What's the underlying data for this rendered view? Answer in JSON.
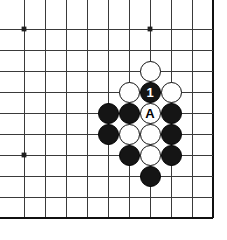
{
  "board": {
    "kind": "go-board-diagram",
    "title": "Go board position diagram",
    "background_color": "#ffffff",
    "line_color": "#3a3a3a",
    "edge_color": "#101010",
    "star_point_color": "#202020",
    "black_stone_color": "#151515",
    "white_stone_color": "#ffffff",
    "geometry": {
      "origin_x": 24,
      "origin_y": 29,
      "cell": 21,
      "cols": 10,
      "rows": 10,
      "stone_radius": 10.5,
      "line_width": 1,
      "edge_line_width": 2.4,
      "star_radius": 2.4
    },
    "edges": {
      "right": true,
      "bottom": true,
      "top": false,
      "left": false
    },
    "star_points": [
      {
        "col": 0,
        "row": 0
      },
      {
        "col": 6,
        "row": 0
      },
      {
        "col": 0,
        "row": 6
      }
    ],
    "stones": [
      {
        "col": 6,
        "row": 2,
        "color": "white",
        "label": ""
      },
      {
        "col": 5,
        "row": 3,
        "color": "white",
        "label": ""
      },
      {
        "col": 6,
        "row": 3,
        "color": "black",
        "label": "1"
      },
      {
        "col": 7,
        "row": 3,
        "color": "white",
        "label": ""
      },
      {
        "col": 4,
        "row": 4,
        "color": "black",
        "label": ""
      },
      {
        "col": 5,
        "row": 4,
        "color": "black",
        "label": ""
      },
      {
        "col": 6,
        "row": 4,
        "color": "white",
        "label": "A"
      },
      {
        "col": 7,
        "row": 4,
        "color": "black",
        "label": ""
      },
      {
        "col": 4,
        "row": 5,
        "color": "black",
        "label": ""
      },
      {
        "col": 5,
        "row": 5,
        "color": "white",
        "label": ""
      },
      {
        "col": 6,
        "row": 5,
        "color": "white",
        "label": ""
      },
      {
        "col": 7,
        "row": 5,
        "color": "black",
        "label": ""
      },
      {
        "col": 5,
        "row": 6,
        "color": "black",
        "label": ""
      },
      {
        "col": 6,
        "row": 6,
        "color": "white",
        "label": ""
      },
      {
        "col": 7,
        "row": 6,
        "color": "black",
        "label": ""
      },
      {
        "col": 6,
        "row": 7,
        "color": "black",
        "label": ""
      }
    ],
    "move_number_label": "1",
    "marked_point_label": "A"
  }
}
